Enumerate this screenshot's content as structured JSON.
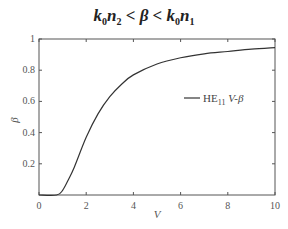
{
  "chart_data": {
    "type": "line",
    "title": "k0n2 < β < k0n1",
    "title_parts": {
      "left": "k",
      "sub1": "0",
      "n1": "n",
      "sub2": "2",
      "mid1": " < β < ",
      "k2": "k",
      "sub3": "0",
      "n2": "n",
      "sub4": "1"
    },
    "xlabel": "V",
    "ylabel": "β",
    "xlim": [
      0,
      10
    ],
    "ylim": [
      0,
      1
    ],
    "xticks": [
      0,
      2,
      4,
      6,
      8,
      10
    ],
    "xtick_labels": [
      "0",
      "2",
      "4",
      "6",
      "8",
      "10"
    ],
    "yticks": [
      0.2,
      0.4,
      0.6,
      0.8,
      1
    ],
    "ytick_labels": [
      "0.2",
      "0.4",
      "0.6",
      "0.8",
      "1"
    ],
    "grid": false,
    "legend_position": "right-center",
    "series": [
      {
        "name": "HE11 V-β",
        "legend_main": "HE",
        "legend_sub": "11",
        "legend_suffix": " V-β",
        "color": "#333333",
        "x": [
          0,
          0.75,
          1.0,
          1.25,
          1.5,
          2.0,
          2.5,
          3.0,
          3.5,
          4.0,
          5.0,
          6.0,
          7.0,
          8.0,
          9.0,
          10.0
        ],
        "values": [
          0,
          0,
          0.03,
          0.1,
          0.18,
          0.37,
          0.52,
          0.63,
          0.71,
          0.77,
          0.84,
          0.88,
          0.905,
          0.92,
          0.935,
          0.945
        ]
      }
    ]
  }
}
